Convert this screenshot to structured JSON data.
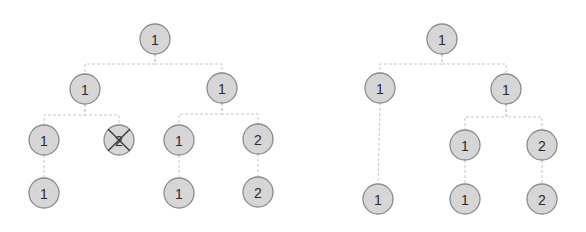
{
  "diagram": {
    "type": "tree-comparison",
    "trees": [
      {
        "name": "left-tree",
        "nodes": [
          {
            "id": "a",
            "label": "1",
            "x": 155,
            "y": 39
          },
          {
            "id": "b",
            "label": "1",
            "x": 85,
            "y": 89
          },
          {
            "id": "c",
            "label": "1",
            "x": 222,
            "y": 88
          },
          {
            "id": "d",
            "label": "1",
            "x": 44,
            "y": 140
          },
          {
            "id": "e",
            "label": "2",
            "x": 119,
            "y": 140,
            "deleted": true
          },
          {
            "id": "f",
            "label": "1",
            "x": 179,
            "y": 140
          },
          {
            "id": "g",
            "label": "2",
            "x": 258,
            "y": 139
          },
          {
            "id": "h",
            "label": "1",
            "x": 44,
            "y": 193
          },
          {
            "id": "i",
            "label": "1",
            "x": 179,
            "y": 193
          },
          {
            "id": "j",
            "label": "2",
            "x": 258,
            "y": 192
          }
        ],
        "edges": [
          [
            "a",
            "b"
          ],
          [
            "a",
            "c"
          ],
          [
            "b",
            "d"
          ],
          [
            "b",
            "e"
          ],
          [
            "c",
            "f"
          ],
          [
            "c",
            "g"
          ],
          [
            "d",
            "h"
          ],
          [
            "f",
            "i"
          ],
          [
            "g",
            "j"
          ]
        ]
      },
      {
        "name": "right-tree",
        "nodes": [
          {
            "id": "a",
            "label": "1",
            "x": 442,
            "y": 39
          },
          {
            "id": "b",
            "label": "1",
            "x": 380,
            "y": 88
          },
          {
            "id": "c",
            "label": "1",
            "x": 506,
            "y": 89
          },
          {
            "id": "f",
            "label": "1",
            "x": 465,
            "y": 145
          },
          {
            "id": "g",
            "label": "2",
            "x": 542,
            "y": 145
          },
          {
            "id": "h",
            "label": "1",
            "x": 378,
            "y": 199
          },
          {
            "id": "i",
            "label": "1",
            "x": 465,
            "y": 199
          },
          {
            "id": "j",
            "label": "2",
            "x": 542,
            "y": 199
          }
        ],
        "edges": [
          [
            "a",
            "b"
          ],
          [
            "a",
            "c"
          ],
          [
            "b",
            "h"
          ],
          [
            "c",
            "f"
          ],
          [
            "c",
            "g"
          ],
          [
            "f",
            "i"
          ],
          [
            "g",
            "j"
          ]
        ]
      }
    ],
    "colors": {
      "node_fill": "#d6d6d6",
      "node_stroke": "#8a8a8a",
      "edge": "#c8c8c8",
      "text": "#2a2a2a",
      "cross": "#3a3a3a"
    },
    "node_radius": 15
  }
}
